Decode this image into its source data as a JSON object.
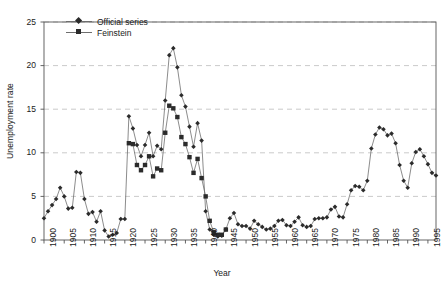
{
  "chart_data": {
    "type": "line",
    "title": "",
    "xlabel": "Year",
    "ylabel": "Unemployment rate",
    "xlim": [
      1900,
      1997
    ],
    "ylim": [
      0,
      25
    ],
    "yticks": [
      0,
      5,
      10,
      15,
      20,
      25
    ],
    "xticks": [
      1900,
      1905,
      1910,
      1915,
      1920,
      1925,
      1930,
      1935,
      1940,
      1945,
      1950,
      1955,
      1960,
      1965,
      1970,
      1975,
      1980,
      1985,
      1990,
      1995
    ],
    "grid": "horizontal-dashed",
    "legend_position": "top-left",
    "marker_color": "#2b2b2b",
    "line_color": "#6e6e6e",
    "grid_color": "#bdbdbd",
    "axis_color": "#555555",
    "series": [
      {
        "name": "Official series",
        "marker": "diamond",
        "x": [
          1900,
          1901,
          1902,
          1903,
          1904,
          1905,
          1906,
          1907,
          1908,
          1909,
          1910,
          1911,
          1912,
          1913,
          1914,
          1915,
          1916,
          1917,
          1918,
          1919,
          1920,
          1921,
          1922,
          1923,
          1924,
          1925,
          1926,
          1927,
          1928,
          1929,
          1930,
          1931,
          1932,
          1933,
          1934,
          1935,
          1936,
          1937,
          1938,
          1939,
          1940,
          1941,
          1942,
          1943,
          1944,
          1945,
          1946,
          1947,
          1948,
          1949,
          1950,
          1951,
          1952,
          1953,
          1954,
          1955,
          1956,
          1957,
          1958,
          1959,
          1960,
          1961,
          1962,
          1963,
          1964,
          1965,
          1966,
          1967,
          1968,
          1969,
          1970,
          1971,
          1972,
          1973,
          1974,
          1975,
          1976,
          1977,
          1978,
          1979,
          1980,
          1981,
          1982,
          1983,
          1984,
          1985,
          1986,
          1987,
          1988,
          1989,
          1990,
          1991,
          1992,
          1993,
          1994,
          1995,
          1996,
          1997
        ],
        "y": [
          2.5,
          3.3,
          4.0,
          4.7,
          6.0,
          5.0,
          3.6,
          3.7,
          7.8,
          7.7,
          4.7,
          3.0,
          3.2,
          2.1,
          3.3,
          1.1,
          0.4,
          0.6,
          0.8,
          2.4,
          2.4,
          14.2,
          12.8,
          10.9,
          9.6,
          10.9,
          12.3,
          9.6,
          10.8,
          10.4,
          16.0,
          21.2,
          22.0,
          19.8,
          16.6,
          15.3,
          13.0,
          10.7,
          13.4,
          11.4,
          3.3,
          1.2,
          0.6,
          0.4,
          0.5,
          1.2,
          2.5,
          3.1,
          1.8,
          1.6,
          1.6,
          1.3,
          2.2,
          1.8,
          1.5,
          1.2,
          1.3,
          1.6,
          2.2,
          2.3,
          1.7,
          1.6,
          2.1,
          2.6,
          1.7,
          1.5,
          1.6,
          2.4,
          2.5,
          2.5,
          2.6,
          3.5,
          3.8,
          2.7,
          2.6,
          4.1,
          5.7,
          6.2,
          6.1,
          5.7,
          6.8,
          10.5,
          12.1,
          12.9,
          12.7,
          12.0,
          12.2,
          11.1,
          8.6,
          6.8,
          6.0,
          8.8,
          10.1,
          10.4,
          9.6,
          8.7,
          7.7,
          7.4
        ]
      },
      {
        "name": "Feinstein",
        "marker": "square",
        "x": [
          1921,
          1922,
          1923,
          1924,
          1925,
          1926,
          1927,
          1928,
          1929,
          1930,
          1931,
          1932,
          1933,
          1934,
          1935,
          1936,
          1937,
          1938,
          1939,
          1940,
          1941,
          1942,
          1943,
          1944,
          1945
        ],
        "y": [
          11.1,
          11.0,
          8.6,
          8.0,
          8.6,
          9.6,
          7.3,
          8.2,
          8.0,
          12.3,
          15.4,
          15.1,
          14.1,
          11.8,
          11.0,
          9.5,
          7.7,
          9.3,
          7.1,
          5.0,
          2.2,
          0.9,
          0.6,
          0.6,
          1.2
        ]
      }
    ]
  },
  "legend": {
    "items": [
      {
        "label": "Official series"
      },
      {
        "label": "Feinstein"
      }
    ]
  },
  "axes": {
    "y_title": "Unemployment rate",
    "x_title": "Year",
    "y_tick_labels": [
      "0",
      "5",
      "10",
      "15",
      "20",
      "25"
    ],
    "x_tick_labels": [
      "1900",
      "1905",
      "1910",
      "1915",
      "1920",
      "1925",
      "1930",
      "1935",
      "1940",
      "1945",
      "1950",
      "1955",
      "1960",
      "1965",
      "1970",
      "1975",
      "1980",
      "1985",
      "1990",
      "1995"
    ]
  }
}
